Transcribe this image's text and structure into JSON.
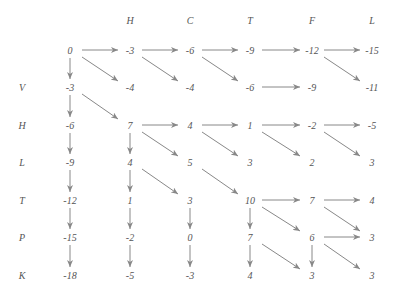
{
  "diagram": {
    "type": "dynamic-programming-alignment-grid",
    "column_labels": [
      "H",
      "C",
      "T",
      "F",
      "L"
    ],
    "row_labels": [
      "V",
      "H",
      "L",
      "T",
      "P",
      "K"
    ],
    "cells": [
      [
        "0",
        "-3",
        "-6",
        "-9",
        "-12",
        "-15"
      ],
      [
        "-3",
        "-4",
        "-4",
        "-6",
        "-9",
        "-11"
      ],
      [
        "-6",
        "7",
        "4",
        "1",
        "-2",
        "-5"
      ],
      [
        "-9",
        "4",
        "5",
        "3",
        "2",
        "3"
      ],
      [
        "-12",
        "1",
        "3",
        "10",
        "7",
        "4"
      ],
      [
        "-15",
        "-2",
        "0",
        "7",
        "6",
        "3"
      ],
      [
        "-18",
        "-5",
        "-3",
        "4",
        "3",
        "3"
      ]
    ],
    "arrows": {
      "horizontal": [
        [
          0,
          0
        ],
        [
          0,
          1
        ],
        [
          0,
          2
        ],
        [
          0,
          3
        ],
        [
          0,
          4
        ],
        [
          1,
          3
        ],
        [
          2,
          1
        ],
        [
          2,
          2
        ],
        [
          2,
          3
        ],
        [
          2,
          4
        ],
        [
          4,
          3
        ],
        [
          4,
          4
        ],
        [
          5,
          4
        ]
      ],
      "diagonal": [
        [
          0,
          0
        ],
        [
          0,
          1
        ],
        [
          0,
          2
        ],
        [
          0,
          4
        ],
        [
          1,
          0
        ],
        [
          2,
          1
        ],
        [
          2,
          2
        ],
        [
          2,
          3
        ],
        [
          2,
          4
        ],
        [
          3,
          1
        ],
        [
          3,
          2
        ],
        [
          4,
          3
        ],
        [
          4,
          4
        ],
        [
          5,
          3
        ],
        [
          5,
          4
        ]
      ],
      "vertical": [
        [
          0,
          0
        ],
        [
          1,
          0
        ],
        [
          2,
          0
        ],
        [
          3,
          0
        ],
        [
          4,
          0
        ],
        [
          5,
          0
        ],
        [
          2,
          1
        ],
        [
          3,
          1
        ],
        [
          4,
          1
        ],
        [
          5,
          1
        ],
        [
          4,
          2
        ],
        [
          5,
          2
        ],
        [
          4,
          3
        ],
        [
          5,
          3
        ],
        [
          5,
          4
        ]
      ]
    },
    "colors": {
      "text": "#555555",
      "arrow": "#888888"
    }
  }
}
